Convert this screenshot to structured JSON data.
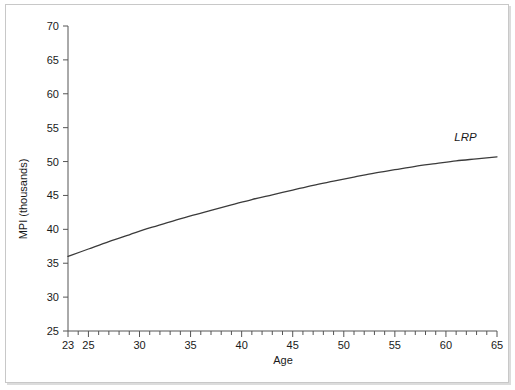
{
  "chart_data": {
    "type": "line",
    "title": "",
    "xlabel": "Age",
    "ylabel": "MPI (thousands)",
    "xlim": [
      23,
      65
    ],
    "ylim": [
      25,
      70
    ],
    "grid": false,
    "legend_position": "inline-right",
    "x_ticks_major": [
      23,
      25,
      30,
      35,
      40,
      45,
      50,
      55,
      60,
      65
    ],
    "x_ticks_minor_step": 1,
    "y_ticks_major": [
      25,
      30,
      35,
      40,
      45,
      50,
      55,
      60,
      65,
      70
    ],
    "series": [
      {
        "name": "LRP",
        "label": "LRP",
        "color": "#3b3b3b",
        "x": [
          23,
          25,
          27,
          29,
          31,
          33,
          35,
          37,
          39,
          41,
          43,
          45,
          47,
          49,
          51,
          53,
          55,
          57,
          59,
          61,
          63,
          65
        ],
        "values": [
          36.0,
          37.1,
          38.2,
          39.2,
          40.2,
          41.1,
          42.0,
          42.8,
          43.6,
          44.4,
          45.1,
          45.8,
          46.5,
          47.1,
          47.7,
          48.3,
          48.8,
          49.3,
          49.7,
          50.1,
          50.4,
          50.7
        ]
      }
    ],
    "annotations": [
      {
        "text": "LRP",
        "x": 62.0,
        "y": 53.0,
        "style": "italic"
      }
    ]
  },
  "axes": {
    "x_tick_labels": [
      "23",
      "25",
      "30",
      "35",
      "40",
      "45",
      "50",
      "55",
      "60",
      "65"
    ],
    "y_tick_labels": [
      "25",
      "30",
      "35",
      "40",
      "45",
      "50",
      "55",
      "60",
      "65",
      "70"
    ],
    "x_axis_title": "Age",
    "y_axis_title": "MPI (thousands)"
  },
  "style": {
    "axis_color": "#555555",
    "line_color": "#3b3b3b",
    "text_color": "#1a1a1a",
    "frame_color": "#c8c8c8",
    "background": "#ffffff"
  }
}
